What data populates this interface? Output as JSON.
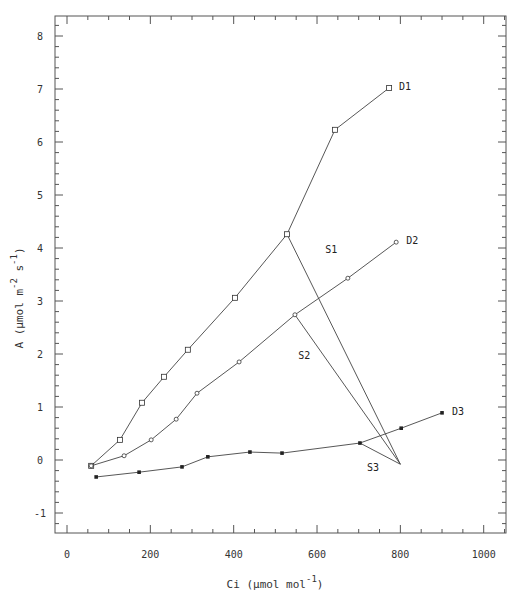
{
  "chart_data": {
    "type": "line",
    "title": "",
    "xlabel": "Ci (µmol mol-1)",
    "ylabel": "A (µmol m-2 s-1)",
    "xlabel_parts": {
      "base": "Ci  (µmol mol",
      "sup": "-1",
      "close": ")"
    },
    "ylabel_parts": {
      "base": "A  (µmol m",
      "sup1": "-2",
      "mid": " s",
      "sup2": "-1",
      "close": ")"
    },
    "xlim": [
      -100,
      1050
    ],
    "ylim": [
      -1.4,
      8.4
    ],
    "x_ticks": [
      0,
      200,
      400,
      600,
      800,
      1000
    ],
    "x_tick_labels": [
      "0",
      "200",
      "400",
      "600",
      "800",
      "1000"
    ],
    "y_ticks": [
      -1,
      0,
      1,
      2,
      3,
      4,
      5,
      6,
      7,
      8
    ],
    "y_tick_labels": [
      "-1",
      "0",
      "1",
      "2",
      "3",
      "4",
      "5",
      "6",
      "7",
      "8"
    ],
    "grid": false,
    "legend": "inline labels at line ends",
    "series": [
      {
        "name": "D1",
        "marker": "square",
        "points": [
          [
            58,
            -0.11
          ],
          [
            127,
            0.38
          ],
          [
            180,
            1.08
          ],
          [
            233,
            1.57
          ],
          [
            290,
            2.08
          ],
          [
            403,
            3.06
          ],
          [
            528,
            4.26
          ],
          [
            643,
            6.23
          ],
          [
            773,
            7.02
          ]
        ]
      },
      {
        "name": "D2",
        "marker": "circle",
        "points": [
          [
            58,
            -0.11
          ],
          [
            137,
            0.08
          ],
          [
            202,
            0.38
          ],
          [
            262,
            0.77
          ],
          [
            312,
            1.26
          ],
          [
            413,
            1.85
          ],
          [
            547,
            2.74
          ],
          [
            674,
            3.43
          ],
          [
            790,
            4.11
          ]
        ]
      },
      {
        "name": "D3",
        "marker": "filled-square",
        "points": [
          [
            70,
            -0.32
          ],
          [
            173,
            -0.23
          ],
          [
            276,
            -0.13
          ],
          [
            338,
            0.06
          ],
          [
            439,
            0.15
          ],
          [
            516,
            0.13
          ],
          [
            703,
            0.32
          ],
          [
            802,
            0.6
          ],
          [
            900,
            0.89
          ]
        ]
      }
    ],
    "supply_lines": [
      {
        "name": "S1",
        "from": [
          528,
          4.26
        ],
        "to": [
          800,
          -0.08
        ]
      },
      {
        "name": "S2",
        "from": [
          547,
          2.74
        ],
        "to": [
          800,
          -0.08
        ]
      },
      {
        "name": "S3",
        "from": [
          703,
          0.32
        ],
        "to": [
          800,
          -0.08
        ]
      }
    ],
    "annotations": [
      {
        "text": "S1",
        "x": 620,
        "y": 3.9
      },
      {
        "text": "S2",
        "x": 555,
        "y": 1.9
      },
      {
        "text": "S3",
        "x": 720,
        "y": -0.2
      }
    ]
  }
}
